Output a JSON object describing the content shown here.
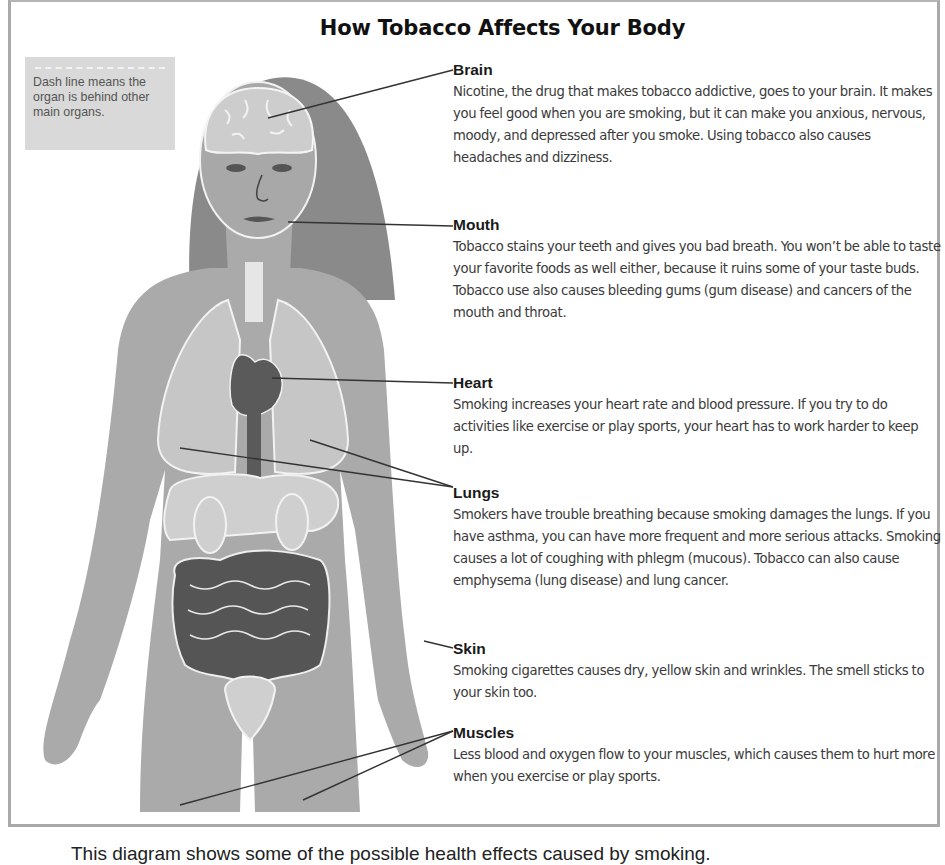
{
  "title": "How Tobacco Affects Your Body",
  "legend": {
    "text": "Dash line means the organ is behind other main organs."
  },
  "sections": [
    {
      "id": "brain",
      "heading": "Brain",
      "body": "Nicotine, the drug that makes tobacco addictive, goes to your brain. It makes you feel good when you are smoking, but it can make you anxious, nervous, moody, and depressed after you smoke. Using tobacco also causes headaches and dizziness."
    },
    {
      "id": "mouth",
      "heading": "Mouth",
      "body": "Tobacco stains your teeth and gives you bad breath. You won’t be able to taste your favorite foods as well either, because it ruins some of your taste buds. Tobacco use also causes bleeding gums (gum disease) and cancers of the mouth and throat."
    },
    {
      "id": "heart",
      "heading": "Heart",
      "body": "Smoking increases your heart rate and blood pressure. If you try to do activities like exercise or play sports, your heart has to work harder to keep up."
    },
    {
      "id": "lungs",
      "heading": "Lungs",
      "body": "Smokers have trouble breathing because smoking damages the lungs. If you have asthma, you can have more frequent and more serious attacks. Smoking causes a lot of coughing with phlegm (mucous). Tobacco can also cause emphysema (lung disease) and lung cancer."
    },
    {
      "id": "skin",
      "heading": "Skin",
      "body": "Smoking cigarettes causes dry, yellow skin and wrinkles. The smell sticks to your skin too."
    },
    {
      "id": "muscles",
      "heading": "Muscles",
      "body": "Less blood and oxygen flow to your muscles, which causes them to hurt more when you exercise or play sports."
    }
  ],
  "caption": "This diagram shows some of the possible health effects caused by smoking.",
  "colors": {
    "hair": "#8a8a8a",
    "skin": "#aaaaaa",
    "organ_light": "#cfcfcf",
    "organ_dark": "#555555",
    "leader_line": "#333333",
    "frame_border": "#a9a9a9",
    "legend_bg": "#d9d9d9"
  }
}
